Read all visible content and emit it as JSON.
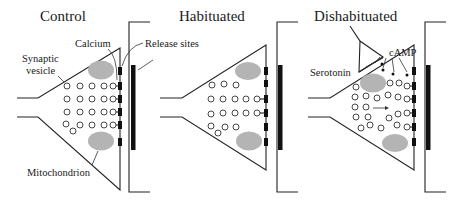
{
  "figure": {
    "type": "diagram",
    "panels": [
      {
        "id": "control",
        "title": "Control",
        "labels": {
          "synaptic_vesicle_line1": "Synaptic",
          "synaptic_vesicle_line2": "vesicle",
          "calcium": "Calcium",
          "release_sites": "Release sites",
          "mitochondrion": "Mitochondrion"
        },
        "vesicles_near_release_sites": 4
      },
      {
        "id": "habituated",
        "title": "Habituated",
        "vesicles_near_release_sites": 2
      },
      {
        "id": "dishabituated",
        "title": "Dishabituated",
        "labels": {
          "serotonin": "Serotonin",
          "camp": "cAMP"
        },
        "vesicles_near_release_sites": 5
      }
    ],
    "colors": {
      "line": "#222222",
      "mitochondrion": "#b4b4b4",
      "release_site": "#111111",
      "background": "#ffffff"
    }
  }
}
